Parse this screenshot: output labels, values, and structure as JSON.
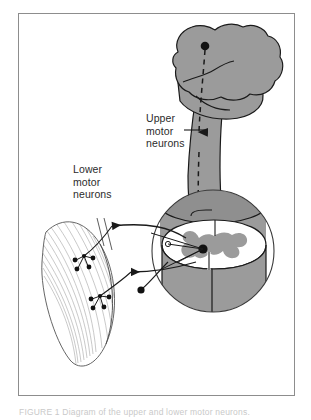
{
  "figure": {
    "labels": {
      "upper_motor_neurons": "Upper\nmotor\nneurons",
      "lower_motor_neurons": "Lower\nmotor\nneurons"
    },
    "caption": "FIGURE 1   Diagram of the upper and lower motor neurons.",
    "parts": {
      "cerebrum": "cerebrum",
      "cerebellum": "cerebellum",
      "brainstem": "brainstem",
      "spinal_cord": "spinal cord",
      "gray_matter": "gray matter butterfly",
      "muscle": "skeletal muscle",
      "motor_end_plate": "motor end plate",
      "magnifier": "magnified spinal cord inset"
    },
    "colors": {
      "tissue_gray": "#9b9b9b",
      "outline": "#1a1a1a",
      "frame": "#8d8d8d",
      "text": "#2b2b2b",
      "background": "#ffffff",
      "muscle_striation": "#8a8a8a"
    }
  }
}
